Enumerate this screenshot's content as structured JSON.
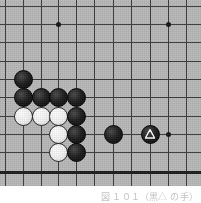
{
  "diagram": {
    "board": {
      "background_color": "#b9b9b9",
      "line_color": "#3a3a3a",
      "edge_line_color": "#1d1d1d",
      "grid_spacing_px": 18.3,
      "origin_x_px": 5,
      "origin_y_px": 6,
      "columns": 11,
      "rows": 10,
      "bottom_edge_row_index": 9,
      "vertical_line_x_px": [
        5,
        23,
        41,
        58,
        76,
        94,
        113,
        131,
        150,
        168,
        186
      ],
      "horizontal_line_y_px": [
        6,
        24,
        42,
        61,
        79,
        97,
        116,
        134,
        152,
        171
      ],
      "bottom_border_y_px": 184
    },
    "star_points": [
      {
        "name": "star-point-upper-left",
        "x": 58,
        "y": 24
      },
      {
        "name": "star-point-upper-right",
        "x": 168,
        "y": 24
      },
      {
        "name": "star-point-right",
        "x": 168,
        "y": 134
      }
    ],
    "stones": [
      {
        "id": "black-lone-upper",
        "color": "black",
        "x": 23,
        "y": 79,
        "mark": null
      },
      {
        "id": "black-row-a1",
        "color": "black",
        "x": 23,
        "y": 97,
        "mark": null
      },
      {
        "id": "black-row-a2",
        "color": "black",
        "x": 41,
        "y": 97,
        "mark": null
      },
      {
        "id": "black-row-a3",
        "color": "black",
        "x": 58,
        "y": 97,
        "mark": null
      },
      {
        "id": "black-row-a4",
        "color": "black",
        "x": 76,
        "y": 97,
        "mark": null
      },
      {
        "id": "white-row-b1",
        "color": "white",
        "x": 23,
        "y": 116,
        "mark": null
      },
      {
        "id": "white-row-b2",
        "color": "white",
        "x": 41,
        "y": 116,
        "mark": null
      },
      {
        "id": "white-row-b3",
        "color": "white",
        "x": 58,
        "y": 116,
        "mark": null
      },
      {
        "id": "black-col-c1",
        "color": "black",
        "x": 76,
        "y": 116,
        "mark": null
      },
      {
        "id": "white-c2",
        "color": "white",
        "x": 58,
        "y": 134,
        "mark": null
      },
      {
        "id": "black-col-c3",
        "color": "black",
        "x": 76,
        "y": 134,
        "mark": null
      },
      {
        "id": "black-right-d1",
        "color": "black",
        "x": 113,
        "y": 134,
        "mark": null
      },
      {
        "id": "black-marked-triangle",
        "color": "black",
        "x": 150,
        "y": 134,
        "mark": "triangle"
      },
      {
        "id": "white-bottom-e1",
        "color": "white",
        "x": 58,
        "y": 152,
        "mark": null
      },
      {
        "id": "black-bottom-e2",
        "color": "black",
        "x": 76,
        "y": 152,
        "mark": null
      }
    ],
    "caption": "図 １０１（黒△ の手）"
  }
}
